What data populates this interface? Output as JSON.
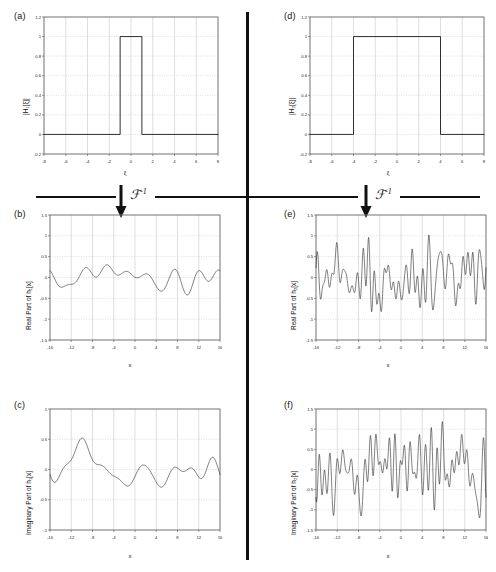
{
  "figure": {
    "transform_symbol": "ℱ",
    "transform_exponent": "-1",
    "divider_color": "#111111",
    "trace_color": "#1a1a1a",
    "grid_color": "#bdbdbd",
    "axis_color": "#555555"
  },
  "panels": [
    {
      "id": "a",
      "label": "(a)",
      "ylabel": "|H₁[ξ]|",
      "xlabel": "ξ",
      "xticks": [
        -8,
        -6,
        -4,
        -2,
        0,
        2,
        4,
        6,
        8
      ],
      "yticks": [
        -0.2,
        0,
        0.2,
        0.4,
        0.6,
        0.8,
        1,
        1.2
      ],
      "xticklabels": [
        "-8",
        "-6",
        "-4",
        "-2",
        "0",
        "2",
        "4",
        "6",
        "8"
      ],
      "yticklabels": [
        "-0.2",
        "0",
        "0.2",
        "0.4",
        "0.6",
        "0.8",
        "1",
        "1.2"
      ],
      "xlim": [
        -8,
        8
      ],
      "ylim": [
        -0.2,
        1.2
      ]
    },
    {
      "id": "b",
      "label": "(b)",
      "ylabel": "Real Part of h₁[x]",
      "xlabel": "x",
      "xticks": [
        -16,
        -12,
        -8,
        -4,
        0,
        4,
        8,
        12,
        16
      ],
      "yticks": [
        -1.5,
        -1,
        -0.5,
        0,
        0.5,
        1,
        1.5
      ],
      "xticklabels": [
        "-16",
        "-12",
        "-8",
        "-4",
        "0",
        "4",
        "8",
        "12",
        "16"
      ],
      "yticklabels": [
        "-1.5",
        "-1",
        "-0.5",
        "0",
        "0.5",
        "1",
        "1.5"
      ],
      "xlim": [
        -16,
        16
      ],
      "ylim": [
        -1.5,
        1.5
      ]
    },
    {
      "id": "c",
      "label": "(c)",
      "ylabel": "Imaginary Part of h₁[x]",
      "xlabel": "x",
      "xticks": [
        -16,
        -12,
        -8,
        -4,
        0,
        4,
        8,
        12,
        16
      ],
      "yticks": [
        -1,
        -0.5,
        0,
        0.5,
        1
      ],
      "xticklabels": [
        "-16",
        "-12",
        "-8",
        "-4",
        "0",
        "4",
        "8",
        "12",
        "16"
      ],
      "yticklabels": [
        "-1",
        "-0.5",
        "0",
        "0.5",
        "1"
      ],
      "xlim": [
        -16,
        16
      ],
      "ylim": [
        -1,
        1
      ]
    },
    {
      "id": "d",
      "label": "(d)",
      "ylabel": "|H₂[ξ]|",
      "xlabel": "ξ",
      "xticks": [
        -8,
        -6,
        -4,
        -2,
        0,
        2,
        4,
        6,
        8
      ],
      "yticks": [
        -0.2,
        0,
        0.2,
        0.4,
        0.6,
        0.8,
        1,
        1.2
      ],
      "xticklabels": [
        "-8",
        "-6",
        "-4",
        "-2",
        "0",
        "2",
        "4",
        "6",
        "8"
      ],
      "yticklabels": [
        "-0.2",
        "0",
        "0.2",
        "0.4",
        "0.6",
        "0.8",
        "1",
        "1.2"
      ],
      "xlim": [
        -8,
        8
      ],
      "ylim": [
        -0.2,
        1.2
      ]
    },
    {
      "id": "e",
      "label": "(e)",
      "ylabel": "Real Part of h₂[x]",
      "xlabel": "x",
      "xticks": [
        -16,
        -12,
        -8,
        -4,
        0,
        4,
        8,
        12,
        16
      ],
      "yticks": [
        -1.5,
        -1,
        -0.5,
        0,
        0.5,
        1,
        1.5
      ],
      "xticklabels": [
        "-16",
        "-12",
        "-8",
        "-4",
        "0",
        "4",
        "8",
        "12",
        "16"
      ],
      "yticklabels": [
        "-1.5",
        "-1",
        "-0.5",
        "0",
        "0.5",
        "1",
        "1.5"
      ],
      "xlim": [
        -16,
        16
      ],
      "ylim": [
        -1.5,
        1.5
      ]
    },
    {
      "id": "f",
      "label": "(f)",
      "ylabel": "Imaginary Part of h₂[x]",
      "xlabel": "x",
      "xticks": [
        -16,
        -12,
        -8,
        -4,
        0,
        4,
        8,
        12,
        16
      ],
      "yticks": [
        -1.5,
        -1,
        -0.5,
        0,
        0.5,
        1,
        1.5
      ],
      "xticklabels": [
        "-16",
        "-12",
        "-8",
        "-4",
        "0",
        "4",
        "8",
        "12",
        "16"
      ],
      "yticklabels": [
        "-1.5",
        "-1",
        "-0.5",
        "0",
        "0.5",
        "1",
        "1.5"
      ],
      "xlim": [
        -16,
        16
      ],
      "ylim": [
        -1.5,
        1.5
      ]
    }
  ],
  "chart_data": [
    {
      "type": "line",
      "panel": "a",
      "title": "(a)",
      "xlabel": "ξ",
      "ylabel": "|H₁[ξ]|",
      "xlim": [
        -8,
        8
      ],
      "ylim": [
        -0.2,
        1.2
      ],
      "grid": true,
      "description": "Rectangular band-pass magnitude, value 1 for |ξ| <= 1, else 0",
      "rect": {
        "left": -1,
        "right": 1,
        "height": 1,
        "baseline": 0
      },
      "x": [
        -8,
        -1,
        -1,
        1,
        1,
        8
      ],
      "y": [
        0,
        0,
        1,
        1,
        0,
        0
      ]
    },
    {
      "type": "line",
      "panel": "d",
      "title": "(d)",
      "xlabel": "ξ",
      "ylabel": "|H₂[ξ]|",
      "xlim": [
        -8,
        8
      ],
      "ylim": [
        -0.2,
        1.2
      ],
      "grid": true,
      "description": "Rectangular band-pass magnitude, value 1 for |ξ| <= 4, else 0",
      "rect": {
        "left": -4,
        "right": 4,
        "height": 1,
        "baseline": 0
      },
      "x": [
        -8,
        -4,
        -4,
        4,
        4,
        8
      ],
      "y": [
        0,
        0,
        1,
        1,
        0,
        0
      ]
    },
    {
      "type": "line",
      "panel": "b",
      "title": "(b)",
      "xlabel": "x",
      "ylabel": "Real Part of h₁[x]",
      "xlim": [
        -16,
        16
      ],
      "ylim": [
        -1.5,
        1.5
      ],
      "grid": true,
      "description": "Real part of inverse FT of narrow rect times random phase; slowly varying band-limited noise, amplitude roughly +/-0.35",
      "n_points": 256,
      "bandwidth": 1,
      "amplitude_rms": 0.15,
      "amplitude_peak": 0.42,
      "seed": 11
    },
    {
      "type": "line",
      "panel": "c",
      "title": "(c)",
      "xlabel": "x",
      "ylabel": "Imaginary Part of h₁[x]",
      "xlim": [
        -16,
        16
      ],
      "ylim": [
        -1,
        1
      ],
      "grid": true,
      "description": "Imaginary part of inverse FT of narrow rect; slowly varying band-limited noise, amplitude roughly +/-0.5",
      "n_points": 256,
      "bandwidth": 1,
      "amplitude_rms": 0.2,
      "amplitude_peak": 0.52,
      "seed": 23
    },
    {
      "type": "line",
      "panel": "e",
      "title": "(e)",
      "xlabel": "x",
      "ylabel": "Real Part of h₂[x]",
      "xlim": [
        -16,
        16
      ],
      "ylim": [
        -1.5,
        1.5
      ],
      "grid": true,
      "description": "Real part of inverse FT of wide rect; rapidly varying broadband noise, amplitude roughly +/-1.0",
      "n_points": 512,
      "bandwidth": 4,
      "amplitude_rms": 0.3,
      "amplitude_peak": 1.02,
      "seed": 37
    },
    {
      "type": "line",
      "panel": "f",
      "title": "(f)",
      "xlabel": "x",
      "ylabel": "Imaginary Part of h₂[x]",
      "xlim": [
        -16,
        16
      ],
      "ylim": [
        -1.5,
        1.5
      ],
      "grid": true,
      "description": "Imaginary part of inverse FT of wide rect; rapidly varying broadband noise, amplitude roughly +/-1.2",
      "n_points": 512,
      "bandwidth": 4,
      "amplitude_rms": 0.32,
      "amplitude_peak": 1.2,
      "seed": 59
    }
  ]
}
